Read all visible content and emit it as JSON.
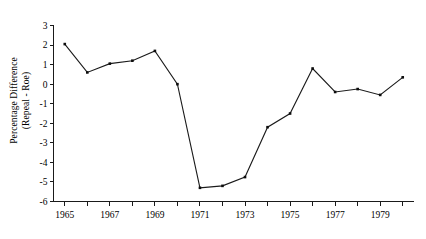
{
  "chart_data": {
    "type": "line",
    "title": "",
    "subtitle": "",
    "xlabel": "",
    "ylabel": "Percentage Difference (Repeal - Roe)",
    "ylabel_line1": "Percentage Difference",
    "ylabel_line2": "(Repeal - Roe)",
    "x": [
      1965,
      1966,
      1967,
      1968,
      1969,
      1970,
      1971,
      1972,
      1973,
      1974,
      1975,
      1976,
      1977,
      1978,
      1979,
      1980
    ],
    "values": [
      2.05,
      0.6,
      1.05,
      1.2,
      1.7,
      0.0,
      -5.3,
      -5.2,
      -4.75,
      -2.2,
      -1.5,
      0.8,
      -0.4,
      -0.25,
      -0.55,
      0.35
    ],
    "series": [
      {
        "name": "Repeal - Roe",
        "values": [
          2.05,
          0.6,
          1.05,
          1.2,
          1.7,
          0.0,
          -5.3,
          -5.2,
          -4.75,
          -2.2,
          -1.5,
          0.8,
          -0.4,
          -0.25,
          -0.55,
          0.35
        ]
      }
    ],
    "xlim": [
      1964.5,
      1980.5
    ],
    "ylim": [
      -6,
      3
    ],
    "ytick_labels": [
      "3",
      "2",
      "1",
      "0",
      "-1",
      "-2",
      "-3",
      "-4",
      "-5",
      "-6"
    ],
    "ytick_values": [
      3,
      2,
      1,
      0,
      -1,
      -2,
      -3,
      -4,
      -5,
      -6
    ],
    "xtick_labels": [
      "1965",
      "1967",
      "1969",
      "1971",
      "1973",
      "1975",
      "1977",
      "1979"
    ],
    "xtick_values": [
      1965,
      1967,
      1969,
      1971,
      1973,
      1975,
      1977,
      1979
    ],
    "xtick_minor_values": [
      1966,
      1968,
      1970,
      1972,
      1974,
      1976,
      1978,
      1980
    ],
    "grid": false,
    "legend": false,
    "legend_position": "none",
    "marker": "square",
    "line_color": "#1a1a1a",
    "marker_color": "#0d0d0d",
    "background_color": "#ffffff"
  }
}
